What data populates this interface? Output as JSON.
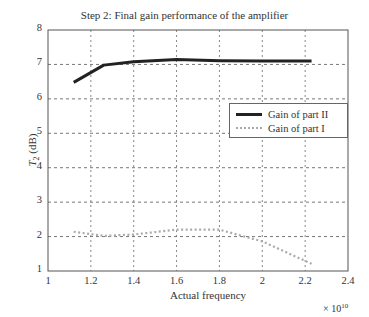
{
  "chart_data": {
    "type": "line",
    "title": "Step 2: Final gain performance of the amplifier",
    "xlabel": "Actual frequency",
    "x_multiplier": "× 10^10",
    "ylabel": "T2 (dB)",
    "xlim": [
      1,
      2.4
    ],
    "ylim": [
      1,
      8
    ],
    "xticks": [
      "1",
      "1.2",
      "1.4",
      "1.6",
      "1.8",
      "2",
      "2.2",
      "2.4"
    ],
    "yticks": [
      "1",
      "2",
      "3",
      "4",
      "5",
      "6",
      "7",
      "8"
    ],
    "grid": true,
    "legend_position": "right-center",
    "series": [
      {
        "name": "Gain of part II",
        "style": "solid",
        "color": "#222222",
        "x": [
          1.12,
          1.26,
          1.4,
          1.6,
          1.8,
          2.0,
          2.23
        ],
        "values": [
          6.48,
          6.98,
          7.08,
          7.14,
          7.11,
          7.1,
          7.1
        ]
      },
      {
        "name": "Gain of part I",
        "style": "dotted",
        "color": "#aaaaaa",
        "x": [
          1.12,
          1.26,
          1.4,
          1.6,
          1.8,
          2.0,
          2.23
        ],
        "values": [
          2.14,
          2.02,
          2.06,
          2.2,
          2.2,
          1.86,
          1.21
        ]
      }
    ]
  },
  "labels": {
    "title": "Step 2: Final gain performance of the amplifier",
    "xlabel": "Actual frequency",
    "exp_base": "× 10",
    "exp_power": "10",
    "ylabel_main": "T",
    "ylabel_sub": "2",
    "ylabel_unit": " (dB)",
    "legend": [
      "Gain of part II",
      "Gain of part I"
    ]
  }
}
